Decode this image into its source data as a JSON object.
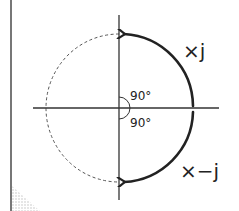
{
  "diagram": {
    "labels": {
      "rotate_ccw": "×j",
      "rotate_cw": "×−j",
      "angle_upper": "90°",
      "angle_lower": "90°"
    },
    "colors": {
      "stroke": "#222222",
      "axis": "#333333",
      "dashed_circle": "#555555",
      "border": "#555555"
    }
  }
}
